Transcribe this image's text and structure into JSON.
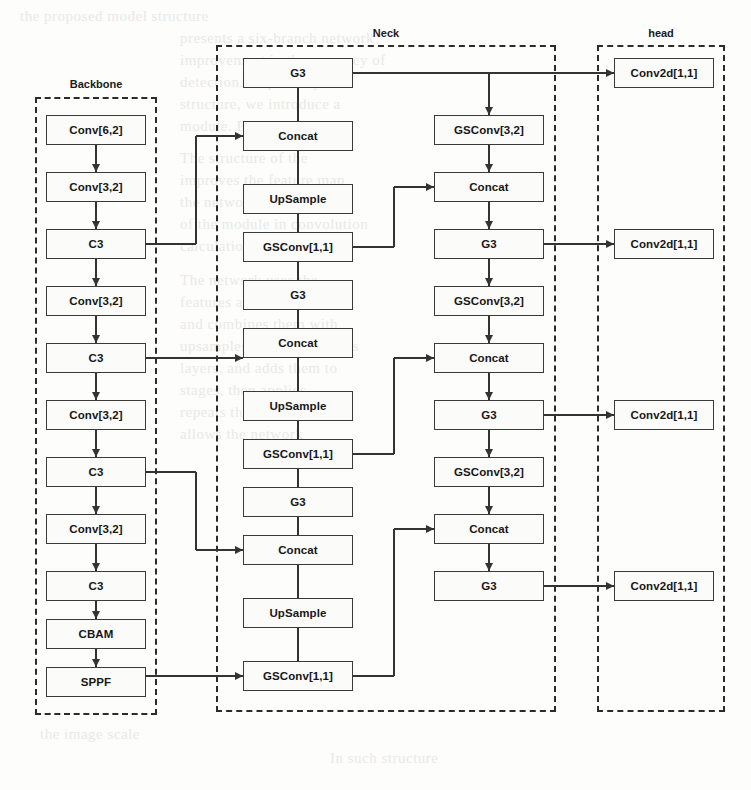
{
  "diagram": {
    "groups": [
      {
        "id": "backbone",
        "label": "Backbone",
        "x": 35,
        "y": 97,
        "w": 122,
        "h": 618,
        "label_x": 35,
        "label_y": 78,
        "label_w": 122
      },
      {
        "id": "neck",
        "label": "Neck",
        "x": 216,
        "y": 45,
        "w": 340,
        "h": 667,
        "label_x": 356,
        "label_y": 27,
        "label_w": 60
      },
      {
        "id": "head",
        "label": "head",
        "x": 597,
        "y": 45,
        "w": 128,
        "h": 667,
        "label_x": 597,
        "label_y": 27,
        "label_w": 128
      }
    ],
    "nodes": [
      {
        "id": "bb1",
        "label": "Conv[6,2]",
        "x": 46,
        "y": 115,
        "w": 100,
        "h": 30
      },
      {
        "id": "bb2",
        "label": "Conv[3,2]",
        "x": 46,
        "y": 172,
        "w": 100,
        "h": 30
      },
      {
        "id": "bb3",
        "label": "C3",
        "x": 46,
        "y": 229,
        "w": 100,
        "h": 30
      },
      {
        "id": "bb4",
        "label": "Conv[3,2]",
        "x": 46,
        "y": 286,
        "w": 100,
        "h": 30
      },
      {
        "id": "bb5",
        "label": "C3",
        "x": 46,
        "y": 343,
        "w": 100,
        "h": 30
      },
      {
        "id": "bb6",
        "label": "Conv[3,2]",
        "x": 46,
        "y": 400,
        "w": 100,
        "h": 30
      },
      {
        "id": "bb7",
        "label": "C3",
        "x": 46,
        "y": 457,
        "w": 100,
        "h": 30
      },
      {
        "id": "bb8",
        "label": "Conv[3,2]",
        "x": 46,
        "y": 514,
        "w": 100,
        "h": 30
      },
      {
        "id": "bb9",
        "label": "C3",
        "x": 46,
        "y": 571,
        "w": 100,
        "h": 30
      },
      {
        "id": "bb10",
        "label": "CBAM",
        "x": 46,
        "y": 619,
        "w": 100,
        "h": 30
      },
      {
        "id": "bb11",
        "label": "SPPF",
        "x": 46,
        "y": 667,
        "w": 100,
        "h": 30
      },
      {
        "id": "nl1",
        "label": "G3",
        "x": 243,
        "y": 58,
        "w": 110,
        "h": 30
      },
      {
        "id": "nl2",
        "label": "Concat",
        "x": 243,
        "y": 121,
        "w": 110,
        "h": 30
      },
      {
        "id": "nl3",
        "label": "UpSample",
        "x": 243,
        "y": 184,
        "w": 110,
        "h": 30
      },
      {
        "id": "nl4",
        "label": "GSConv[1,1]",
        "x": 243,
        "y": 232,
        "w": 110,
        "h": 30
      },
      {
        "id": "nl5",
        "label": "G3",
        "x": 243,
        "y": 280,
        "w": 110,
        "h": 30
      },
      {
        "id": "nl6",
        "label": "Concat",
        "x": 243,
        "y": 328,
        "w": 110,
        "h": 30
      },
      {
        "id": "nl7",
        "label": "UpSample",
        "x": 243,
        "y": 391,
        "w": 110,
        "h": 30
      },
      {
        "id": "nl8",
        "label": "GSConv[1,1]",
        "x": 243,
        "y": 439,
        "w": 110,
        "h": 30
      },
      {
        "id": "nl9",
        "label": "G3",
        "x": 243,
        "y": 487,
        "w": 110,
        "h": 30
      },
      {
        "id": "nl10",
        "label": "Concat",
        "x": 243,
        "y": 535,
        "w": 110,
        "h": 30
      },
      {
        "id": "nl11",
        "label": "UpSample",
        "x": 243,
        "y": 598,
        "w": 110,
        "h": 30
      },
      {
        "id": "nl12",
        "label": "GSConv[1,1]",
        "x": 243,
        "y": 661,
        "w": 110,
        "h": 30
      },
      {
        "id": "nr1",
        "label": "GSConv[3,2]",
        "x": 434,
        "y": 115,
        "w": 110,
        "h": 30
      },
      {
        "id": "nr2",
        "label": "Concat",
        "x": 434,
        "y": 172,
        "w": 110,
        "h": 30
      },
      {
        "id": "nr3",
        "label": "G3",
        "x": 434,
        "y": 229,
        "w": 110,
        "h": 30
      },
      {
        "id": "nr4",
        "label": "GSConv[3,2]",
        "x": 434,
        "y": 286,
        "w": 110,
        "h": 30
      },
      {
        "id": "nr5",
        "label": "Concat",
        "x": 434,
        "y": 343,
        "w": 110,
        "h": 30
      },
      {
        "id": "nr6",
        "label": "G3",
        "x": 434,
        "y": 400,
        "w": 110,
        "h": 30
      },
      {
        "id": "nr7",
        "label": "GSConv[3,2]",
        "x": 434,
        "y": 457,
        "w": 110,
        "h": 30
      },
      {
        "id": "nr8",
        "label": "Concat",
        "x": 434,
        "y": 514,
        "w": 110,
        "h": 30
      },
      {
        "id": "nr9",
        "label": "G3",
        "x": 434,
        "y": 571,
        "w": 110,
        "h": 30
      },
      {
        "id": "hd1",
        "label": "Conv2d[1,1]",
        "x": 614,
        "y": 58,
        "w": 100,
        "h": 30
      },
      {
        "id": "hd2",
        "label": "Conv2d[1,1]",
        "x": 614,
        "y": 229,
        "w": 100,
        "h": 30
      },
      {
        "id": "hd3",
        "label": "Conv2d[1,1]",
        "x": 614,
        "y": 400,
        "w": 100,
        "h": 30
      },
      {
        "id": "hd4",
        "label": "Conv2d[1,1]",
        "x": 614,
        "y": 571,
        "w": 100,
        "h": 30
      }
    ],
    "bleed_texts": [
      {
        "text": "the proposed model structure",
        "x": 20,
        "y": 8
      },
      {
        "text": "presents a six-branch network",
        "x": 180,
        "y": 30
      },
      {
        "text": "improvement in the accuracy of",
        "x": 180,
        "y": 52
      },
      {
        "text": "detection. Inspired by the",
        "x": 180,
        "y": 74
      },
      {
        "text": "structure, we introduce a",
        "x": 180,
        "y": 96
      },
      {
        "text": "module. Please see the",
        "x": 180,
        "y": 118
      },
      {
        "text": "The structure of the",
        "x": 180,
        "y": 150
      },
      {
        "text": "improves the feature map",
        "x": 180,
        "y": 172
      },
      {
        "text": "the network representation",
        "x": 180,
        "y": 194
      },
      {
        "text": "of the module in convolution",
        "x": 180,
        "y": 216
      },
      {
        "text": "calculation is described",
        "x": 180,
        "y": 238
      },
      {
        "text": "The network uses the",
        "x": 180,
        "y": 272
      },
      {
        "text": "features at various scales",
        "x": 180,
        "y": 294
      },
      {
        "text": "and combines them with",
        "x": 180,
        "y": 316
      },
      {
        "text": "upsamples the feature maps",
        "x": 180,
        "y": 338
      },
      {
        "text": "layers, and adds them to",
        "x": 180,
        "y": 360
      },
      {
        "text": "stages, then applies",
        "x": 180,
        "y": 382
      },
      {
        "text": "repeats this process",
        "x": 180,
        "y": 404
      },
      {
        "text": "allows the network",
        "x": 180,
        "y": 426
      },
      {
        "text": "the image scale",
        "x": 40,
        "y": 726
      },
      {
        "text": "In such structure",
        "x": 330,
        "y": 750
      }
    ]
  }
}
